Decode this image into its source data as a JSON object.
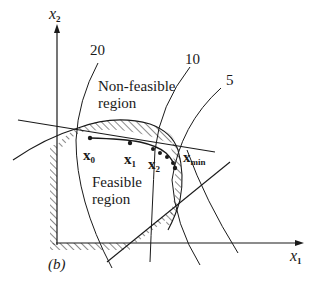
{
  "figure": {
    "panel_label": "(b)",
    "axes": {
      "x_axis": {
        "label": "x",
        "subscript": "1"
      },
      "y_axis": {
        "label": "x",
        "subscript": "2"
      }
    },
    "regions": {
      "non_feasible": {
        "line1": "Non-feasible",
        "line2": "region"
      },
      "feasible": {
        "line1": "Feasible",
        "line2": "region"
      }
    },
    "contours": [
      {
        "value": "20"
      },
      {
        "value": "10"
      },
      {
        "value": "5"
      }
    ],
    "points": [
      {
        "label": "x",
        "subscript": "0"
      },
      {
        "label": "x",
        "subscript": "1"
      },
      {
        "label": "x",
        "subscript": "2"
      },
      {
        "label": "x",
        "subscript": "min"
      }
    ],
    "colors": {
      "ink": "#1a1a1a",
      "background": "#ffffff"
    }
  }
}
